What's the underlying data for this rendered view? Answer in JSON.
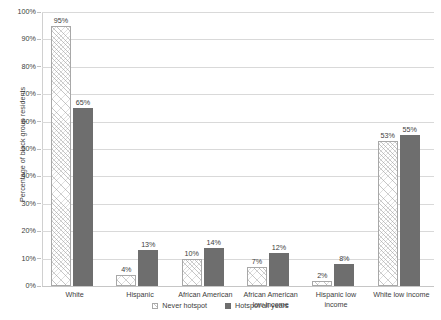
{
  "chart_data": {
    "type": "bar",
    "title": "",
    "title_remnant": "",
    "xlabel": "",
    "ylabel": "Percentage of block group residents",
    "ylim": [
      0,
      100
    ],
    "ytick_labels": [
      "0%",
      "10%",
      "20%",
      "30%",
      "40%",
      "50%",
      "60%",
      "70%",
      "80%",
      "90%",
      "100%"
    ],
    "ytick_values": [
      0,
      10,
      20,
      30,
      40,
      50,
      60,
      70,
      80,
      90,
      100
    ],
    "grid": true,
    "grid_axis": "y",
    "legend_position": "bottom-center",
    "categories": [
      "White",
      "Hispanic",
      "African American",
      "African American low income",
      "Hispanic low income",
      "White low income"
    ],
    "category_lines": [
      [
        "White"
      ],
      [
        "Hispanic"
      ],
      [
        "African American"
      ],
      [
        "African American",
        "low income"
      ],
      [
        "Hispanic low",
        "income"
      ],
      [
        "White low income"
      ]
    ],
    "series": [
      {
        "name": "Never hotspot",
        "values": [
          95,
          4,
          10,
          7,
          2,
          53
        ],
        "labels": [
          "95%",
          "4%",
          "10%",
          "7%",
          "2%",
          "53%"
        ],
        "color": "#ffffff",
        "pattern": "diagonal-hatch",
        "border_color": "#a8a8a8"
      },
      {
        "name": "Hotspot all years",
        "values": [
          65,
          13,
          14,
          12,
          8,
          55
        ],
        "labels": [
          "65%",
          "13%",
          "14%",
          "12%",
          "8%",
          "55%"
        ],
        "color": "#6e6e6e",
        "pattern": "solid",
        "border_color": "#6e6e6e"
      }
    ]
  },
  "legend": {
    "items": [
      {
        "label": "Never hotspot",
        "swatch": "never-hotspot-swatch"
      },
      {
        "label": "Hotspot all years",
        "swatch": "hotspot-all-years-swatch"
      }
    ]
  },
  "colors": {
    "gridline": "#d9d9d9",
    "axis": "#d0d0d0",
    "text": "#3d3d3d",
    "bar_never_hotspot": "#ffffff",
    "bar_hotspot_all_years": "#6e6e6e",
    "background": "#ffffff"
  }
}
